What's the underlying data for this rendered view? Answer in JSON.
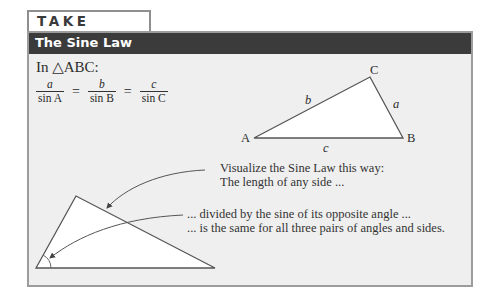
{
  "tag": {
    "label": "TAKE NOTE"
  },
  "header": {
    "title": "The Sine Law"
  },
  "intro": {
    "text": "In △ABC:"
  },
  "formula": {
    "fractions": [
      {
        "numerator": "a",
        "denominator": "sin A"
      },
      {
        "numerator": "b",
        "denominator": "sin B"
      },
      {
        "numerator": "c",
        "denominator": "sin C"
      }
    ],
    "equals": "="
  },
  "triangle_abc": {
    "vertices": {
      "A": "A",
      "B": "B",
      "C": "C"
    },
    "sides": {
      "a": "a",
      "b": "b",
      "c": "c"
    }
  },
  "visualization": {
    "line1": "Visualize the Sine Law this way:",
    "line2": "The length of any side ...",
    "line3": "... divided by the sine of its opposite angle ...",
    "line4": "... is the same for all three pairs of angles and sides."
  },
  "colors": {
    "header_bg": "#3b3b3b",
    "panel_bg": "#efefef",
    "border": "#9c9c9c",
    "triangle_fill": "#ffffff"
  }
}
